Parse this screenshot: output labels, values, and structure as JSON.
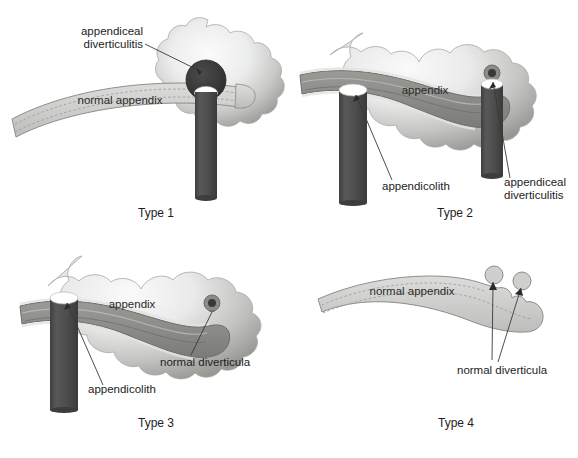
{
  "figure": {
    "panels": [
      {
        "id": "type1",
        "type_label": "Type 1",
        "labels": [
          {
            "name": "appendiceal-diverticulitis",
            "lines": [
              "appendiceal",
              "diverticulitis"
            ]
          },
          {
            "name": "normal-appendix",
            "lines": [
              "normal appendix"
            ]
          }
        ],
        "features": [
          "inflammation-cloud",
          "appendicolith-cylinder",
          "normal-appendix-band",
          "dark-diverticulum"
        ]
      },
      {
        "id": "type2",
        "type_label": "Type 2",
        "labels": [
          {
            "name": "appendix",
            "lines": [
              "appendix"
            ]
          },
          {
            "name": "appendicolith",
            "lines": [
              "appendicolith"
            ]
          },
          {
            "name": "appendiceal-diverticulitis",
            "lines": [
              "appendiceal",
              "diverticulitis"
            ]
          }
        ],
        "features": [
          "inflammation-cloud",
          "inflamed-appendix-band",
          "appendicolith-cylinder-left",
          "appendicolith-cylinder-right",
          "small-diverticulum"
        ]
      },
      {
        "id": "type3",
        "type_label": "Type 3",
        "labels": [
          {
            "name": "appendix",
            "lines": [
              "appendix"
            ]
          },
          {
            "name": "normal-diverticula",
            "lines": [
              "normal diverticula"
            ]
          },
          {
            "name": "appendicolith",
            "lines": [
              "appendicolith"
            ]
          }
        ],
        "features": [
          "inflammation-cloud",
          "inflamed-appendix-band",
          "appendicolith-cylinder",
          "small-diverticulum"
        ]
      },
      {
        "id": "type4",
        "type_label": "Type 4",
        "labels": [
          {
            "name": "normal-appendix",
            "lines": [
              "normal appendix"
            ]
          },
          {
            "name": "normal-diverticula",
            "lines": [
              "normal diverticula"
            ]
          }
        ],
        "features": [
          "normal-appendix-band",
          "diverticulum-bud-1",
          "diverticulum-bud-2"
        ]
      }
    ],
    "colors": {
      "appendix_normal_fill": "#cfd0cd",
      "appendix_normal_stroke": "#8e8f8c",
      "appendix_inflamed_fill": "#8b8c88",
      "appendix_inflamed_stroke": "#6d6e6a",
      "inflammation_light": "#f2f2f1",
      "inflammation_dark": "#9b9c98",
      "appendicolith_dark": "#4a4a4a",
      "appendicolith_top": "#ffffff",
      "diverticulum_dark": "#3a3a3a",
      "leader_line": "#3a3a3a",
      "text": "#1d1d1d",
      "background": "#ffffff"
    }
  },
  "footer": {
    "caption": ""
  }
}
